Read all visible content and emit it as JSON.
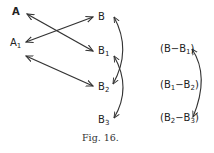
{
  "diagram": {
    "caption": "Fig. 16.",
    "left_nodes": [
      {
        "id": "A",
        "label": "A",
        "sub": ""
      },
      {
        "id": "A1",
        "label": "A",
        "sub": "1"
      }
    ],
    "right_nodes": [
      {
        "id": "B",
        "label": "B",
        "sub": ""
      },
      {
        "id": "B1",
        "label": "B",
        "sub": "1"
      },
      {
        "id": "B2",
        "label": "B",
        "sub": "2"
      },
      {
        "id": "B3",
        "label": "B",
        "sub": "3"
      }
    ],
    "differences": [
      {
        "text": "(B−B",
        "sub": "1",
        "close": ")"
      },
      {
        "text": "(B",
        "sub1": "1",
        "mid": "−B",
        "sub": "2",
        "close": ")"
      },
      {
        "text": "(B",
        "sub1": "2",
        "mid": "−B",
        "sub": "3",
        "close": ")"
      }
    ],
    "edges": [
      {
        "from": "A",
        "to": "B1",
        "type": "double-arrow"
      },
      {
        "from": "A1",
        "to": "B",
        "type": "double-arrow"
      },
      {
        "from": "A1",
        "to": "B2",
        "type": "double-arrow"
      },
      {
        "from": "B",
        "to": "B2",
        "type": "curved-double-arrow"
      },
      {
        "from": "B1",
        "to": "B3",
        "type": "curved-double-arrow"
      },
      {
        "from": "(B-B1)",
        "to": "(B2-B3)",
        "type": "curved-double-arrow"
      }
    ]
  }
}
